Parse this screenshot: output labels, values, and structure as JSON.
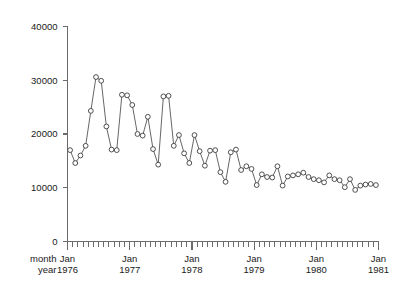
{
  "chart_data": {
    "type": "line",
    "title": "",
    "subtitle": "",
    "xlabel": "",
    "ylabel": "",
    "xlim": [
      "1976-01",
      "1981-01"
    ],
    "ylim": [
      0,
      40000
    ],
    "grid": false,
    "legend": null,
    "marker": "open-circle",
    "row_labels": [
      "month",
      "year"
    ],
    "y_ticks": [
      0,
      10000,
      20000,
      30000,
      40000
    ],
    "y_tick_labels": [
      "0",
      "10000",
      "20000",
      "30000",
      "40000"
    ],
    "x_major_ticks": [
      {
        "month": "Jan",
        "year": "1976"
      },
      {
        "month": "Jan",
        "year": "1977"
      },
      {
        "month": "Jan",
        "year": "1978"
      },
      {
        "month": "Jan",
        "year": "1979"
      },
      {
        "month": "Jan",
        "year": "1980"
      },
      {
        "month": "Jan",
        "year": "1981"
      }
    ],
    "x_minor_tick_interval": "1 month",
    "x": [
      "1976-01",
      "1976-02",
      "1976-03",
      "1976-04",
      "1976-05",
      "1976-06",
      "1976-07",
      "1976-08",
      "1976-09",
      "1976-10",
      "1976-11",
      "1976-12",
      "1977-01",
      "1977-02",
      "1977-03",
      "1977-04",
      "1977-05",
      "1977-06",
      "1977-07",
      "1977-08",
      "1977-09",
      "1977-10",
      "1977-11",
      "1977-12",
      "1978-01",
      "1978-02",
      "1978-03",
      "1978-04",
      "1978-05",
      "1978-06",
      "1978-07",
      "1978-08",
      "1978-09",
      "1978-10",
      "1978-11",
      "1978-12",
      "1979-01",
      "1979-02",
      "1979-03",
      "1979-04",
      "1979-05",
      "1979-06",
      "1979-07",
      "1979-08",
      "1979-09",
      "1979-10",
      "1979-11",
      "1979-12",
      "1980-01",
      "1980-02",
      "1980-03",
      "1980-04",
      "1980-05",
      "1980-06",
      "1980-07",
      "1980-08",
      "1980-09",
      "1980-10",
      "1980-11",
      "1980-12"
    ],
    "values": [
      17000,
      14600,
      16000,
      17800,
      24300,
      30600,
      29900,
      21400,
      17100,
      17000,
      27300,
      27200,
      25400,
      20000,
      19700,
      23200,
      17200,
      14300,
      27000,
      27100,
      17800,
      19800,
      16400,
      14600,
      19800,
      16800,
      14100,
      16900,
      17000,
      12900,
      11100,
      16600,
      17100,
      13300,
      14000,
      13500,
      10500,
      12500,
      12000,
      11900,
      14000,
      10400,
      12100,
      12300,
      12500,
      12800,
      12000,
      11600,
      11400,
      11000,
      12300,
      11600,
      11400,
      10100,
      11600,
      9600,
      10400,
      10600,
      10700,
      10500
    ],
    "series_name": "monthly series"
  }
}
